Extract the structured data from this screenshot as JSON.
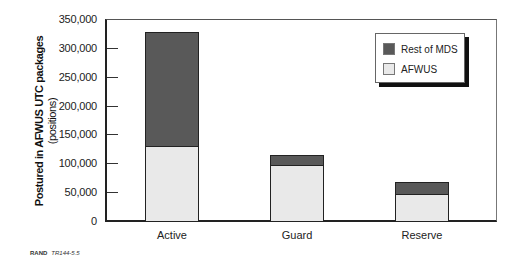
{
  "chart_data": {
    "type": "bar",
    "stacked": true,
    "title": "",
    "xlabel": "",
    "ylabel": "Postured in AFWUS UTC packages",
    "ylabel_sub": "(positions)",
    "categories": [
      "Active",
      "Guard",
      "Reserve"
    ],
    "series": [
      {
        "name": "AFWUS",
        "color": "#e9e9e9",
        "values": [
          130000,
          97000,
          47000
        ]
      },
      {
        "name": "Rest of MDS",
        "color": "#595959",
        "values": [
          197000,
          18000,
          21000
        ]
      }
    ],
    "totals": [
      327000,
      115000,
      68000
    ],
    "ylim": [
      0,
      350000
    ],
    "yticks": [
      0,
      50000,
      100000,
      150000,
      200000,
      250000,
      300000,
      350000
    ],
    "ytick_labels": [
      "0",
      "50,000",
      "100,000",
      "150,000",
      "200,000",
      "250,000",
      "300,000",
      "350,000"
    ],
    "grid": false,
    "legend": {
      "position": "upper right",
      "entries": [
        "Rest of MDS",
        "AFWUS"
      ]
    }
  },
  "legend": {
    "items": [
      {
        "label": "Rest of MDS",
        "color": "#595959"
      },
      {
        "label": "AFWUS",
        "color": "#e9e9e9"
      }
    ]
  },
  "caption": {
    "org": "RAND",
    "id": "TR144-5.5"
  }
}
